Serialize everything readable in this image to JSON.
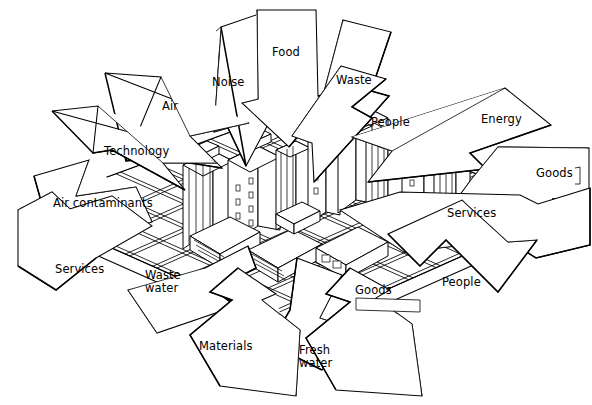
{
  "diagram": {
    "type": "isometric-flow-diagram",
    "background_color": "#ffffff",
    "line_color": "#000000",
    "fill_color": "#ffffff",
    "center_subject": "city",
    "center_description": "Isometric city block grid with high-rise towers and low flat-roofed buildings"
  },
  "labels": {
    "noise": "Noise",
    "food": "Food",
    "waste": "Waste",
    "air": "Air",
    "people_top": "People",
    "energy": "Energy",
    "technology": "Technology",
    "goods_right": "Goods",
    "air_contaminants": "Air contaminants",
    "services_right": "Services",
    "services_left": "Services",
    "waste_water": "Waste\nwater",
    "goods_bottom": "Goods",
    "people_bottom": "People",
    "materials": "Materials",
    "fresh_water": "Fresh\nwater"
  },
  "flows": [
    {
      "label": "Noise",
      "direction": "outbound",
      "bearing": "up"
    },
    {
      "label": "Food",
      "direction": "inbound",
      "bearing": "down"
    },
    {
      "label": "Waste",
      "direction": "outbound",
      "bearing": "up"
    },
    {
      "label": "Air",
      "direction": "inbound",
      "bearing": "down-right"
    },
    {
      "label": "People",
      "direction": "outbound",
      "bearing": "up-right"
    },
    {
      "label": "Energy",
      "direction": "inbound",
      "bearing": "down-left"
    },
    {
      "label": "Technology",
      "direction": "inbound",
      "bearing": "down-right"
    },
    {
      "label": "Goods",
      "direction": "inbound",
      "bearing": "left"
    },
    {
      "label": "Air contaminants",
      "direction": "outbound",
      "bearing": "up-left"
    },
    {
      "label": "Services",
      "direction": "outbound",
      "bearing": "down-right"
    },
    {
      "label": "Services",
      "direction": "outbound",
      "bearing": "left"
    },
    {
      "label": "Waste water",
      "direction": "outbound",
      "bearing": "down-left"
    },
    {
      "label": "Goods",
      "direction": "outbound",
      "bearing": "down"
    },
    {
      "label": "People",
      "direction": "inbound",
      "bearing": "up-left"
    },
    {
      "label": "Materials",
      "direction": "inbound",
      "bearing": "up"
    },
    {
      "label": "Fresh water",
      "direction": "inbound",
      "bearing": "up"
    }
  ]
}
